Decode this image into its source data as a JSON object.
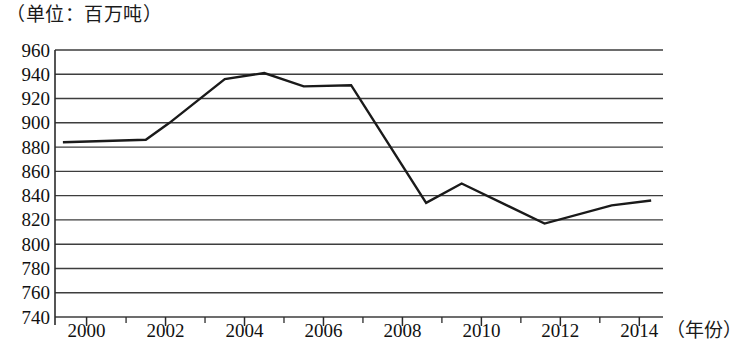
{
  "caption": {
    "unit_label": "（单位：百万吨）"
  },
  "axes": {
    "x_title": "（年份）",
    "y_tick_labels": [
      "960",
      "940",
      "920",
      "900",
      "880",
      "860",
      "840",
      "820",
      "800",
      "780",
      "760",
      "740"
    ],
    "x_tick_labels": [
      "2000",
      "2002",
      "2004",
      "2006",
      "2008",
      "2010",
      "2012",
      "2014"
    ]
  },
  "style": {
    "line_color": "#1a1a1a",
    "grid_color": "#3d3d3d",
    "axis_color": "#2b2b2b",
    "background": "#ffffff"
  },
  "chart_data": {
    "type": "line",
    "title": "",
    "subtitle": "",
    "xlabel": "（年份）",
    "ylabel": "（单位：百万吨）",
    "unit": "百万吨",
    "xlim": [
      1999.2,
      2014.6
    ],
    "ylim": [
      740,
      960
    ],
    "y_ticks": [
      740,
      760,
      780,
      800,
      820,
      840,
      860,
      880,
      900,
      920,
      940,
      960
    ],
    "y_tick_step": 20,
    "x_ticks": [
      2000,
      2002,
      2004,
      2006,
      2008,
      2010,
      2012,
      2014
    ],
    "x_minor_ticks": [
      2001,
      2003,
      2005,
      2007,
      2009,
      2011,
      2013
    ],
    "grid": true,
    "grid_axis": "y",
    "legend": false,
    "legend_position": "none",
    "x": [
      1999.4,
      2001.5,
      2002.1,
      2003.5,
      2004.5,
      2005.5,
      2006.7,
      2008.6,
      2009.5,
      2011.6,
      2013.3,
      2014.3
    ],
    "values": [
      884,
      886,
      900,
      936,
      941,
      930,
      931,
      834,
      850,
      817,
      832,
      836
    ],
    "series": [
      {
        "name": "产量",
        "x": [
          1999.4,
          2001.5,
          2002.1,
          2003.5,
          2004.5,
          2005.5,
          2006.7,
          2008.6,
          2009.5,
          2011.6,
          2013.3,
          2014.3
        ],
        "values": [
          884,
          886,
          900,
          936,
          941,
          930,
          931,
          834,
          850,
          817,
          832,
          836
        ]
      }
    ]
  }
}
